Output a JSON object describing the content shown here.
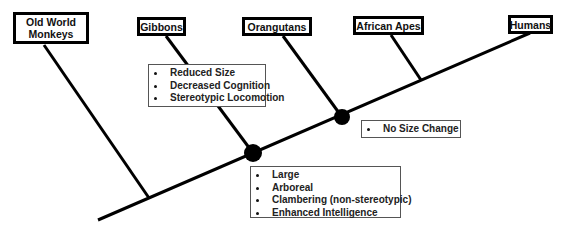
{
  "diagram": {
    "type": "cladogram",
    "taxa": [
      {
        "id": "old-world-monkeys",
        "label": "Old World Monkeys"
      },
      {
        "id": "gibbons",
        "label": "Gibbons"
      },
      {
        "id": "orangutans",
        "label": "Orangutans"
      },
      {
        "id": "african-apes",
        "label": "African Apes"
      },
      {
        "id": "humans",
        "label": "Humans"
      }
    ],
    "trait_boxes": {
      "gibbons": [
        "Reduced Size",
        "Decreased Cognition",
        "Stereotypic Locomotion"
      ],
      "great_ape_node": [
        "Large",
        "Arboreal",
        "Clambering (non-stereotypic)",
        "Enhanced Intelligence"
      ],
      "african_human_node": [
        "No Size Change"
      ]
    },
    "colors": {
      "line": "#000000",
      "node": "#000000",
      "background": "#ffffff"
    }
  }
}
